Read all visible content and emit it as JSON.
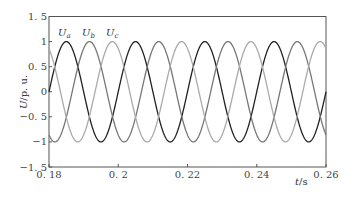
{
  "chart_data": {
    "type": "line",
    "title": "",
    "xlabel": "t/s",
    "ylabel": "U/p. u.",
    "xlim": [
      0.18,
      0.26
    ],
    "ylim": [
      -1.5,
      1.5
    ],
    "xticks": [
      "0.18",
      "0.2",
      "0.22",
      "0.24",
      "0.26"
    ],
    "yticks": [
      "1.5",
      "1",
      "0.5",
      "0",
      "-0.5",
      "-1",
      "-1.5"
    ],
    "grid": false,
    "legend": "inline labels near first peaks",
    "frequency_hz": 50,
    "series": [
      {
        "name": "Ua",
        "label": "U_a",
        "amplitude": 1.0,
        "phase_deg": 0,
        "color": "#222222",
        "first_peak_t": 0.185
      },
      {
        "name": "Ub",
        "label": "U_b",
        "amplitude": 1.0,
        "phase_deg": -120,
        "color": "#777777",
        "first_peak_t": 0.1917
      },
      {
        "name": "Uc",
        "label": "U_c",
        "amplitude": 1.0,
        "phase_deg": 120,
        "color": "#aaaaaa",
        "first_peak_t": 0.1983
      }
    ]
  },
  "labels": {
    "ua": "U",
    "ua_sub": "a",
    "ub": "U",
    "ub_sub": "b",
    "uc": "U",
    "uc_sub": "c",
    "ylabel_u": "U",
    "ylabel_rest": "/p. u.",
    "xlabel_t": "t",
    "xlabel_rest": "/s"
  }
}
